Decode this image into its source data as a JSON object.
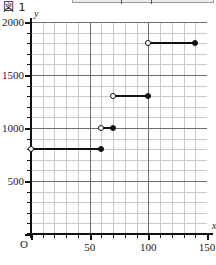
{
  "figure": {
    "caption": "図 1"
  },
  "top_strip": {
    "present": true
  },
  "chart_data": {
    "type": "line",
    "subtype": "step-function",
    "title": "図 1",
    "xlabel": "x",
    "ylabel": "y",
    "origin_label": "O",
    "xlim": [
      0,
      150
    ],
    "ylim": [
      0,
      2000
    ],
    "x_ticks": [
      0,
      50,
      100,
      150
    ],
    "x_tick_labels": [
      "",
      "50",
      "100",
      "150"
    ],
    "y_ticks": [
      0,
      500,
      1000,
      1500,
      2000
    ],
    "y_tick_labels": [
      "",
      "500",
      "1000",
      "1500",
      "2000"
    ],
    "x_minor_step": 10,
    "y_minor_step": 100,
    "grid": true,
    "grid_minor": true,
    "legend": "none",
    "line_color": "#111111",
    "grid_minor_color": "#c9c9c9",
    "grid_major_color": "#6f6f6f",
    "segments": [
      {
        "x_start": 0,
        "x_end": 60,
        "y": 800,
        "left_endpoint": "open",
        "right_endpoint": "closed"
      },
      {
        "x_start": 60,
        "x_end": 70,
        "y": 1000,
        "left_endpoint": "open",
        "right_endpoint": "closed"
      },
      {
        "x_start": 70,
        "x_end": 100,
        "y": 1300,
        "left_endpoint": "open",
        "right_endpoint": "closed"
      },
      {
        "x_start": 100,
        "x_end": 140,
        "y": 1800,
        "left_endpoint": "open",
        "right_endpoint": "closed"
      }
    ]
  }
}
